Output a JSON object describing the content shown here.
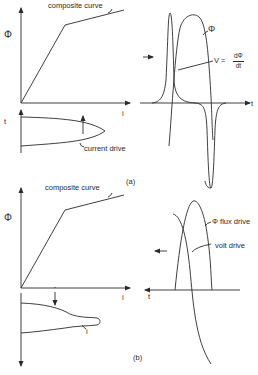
{
  "figure": {
    "panel_a": {
      "label": "(a)",
      "left_plot": {
        "y_axis_label": "Φ",
        "x_axis_label": "i",
        "curve_label": "composite curve",
        "lower_axis_label": "t",
        "drive_label": "current drive",
        "arrow_direction": "up"
      },
      "right_plot": {
        "x_axis_label": "t",
        "phi_label": "Φ",
        "v_label_prefix": "V =",
        "v_label_num": "dΦ",
        "v_label_den": "dt",
        "arrow_direction": "right"
      }
    },
    "panel_b": {
      "label": "(b)",
      "left_plot": {
        "y_axis_label": "Φ",
        "x_axis_label": "i",
        "curve_label": "composite curve",
        "current_label": "i",
        "arrow_direction": "down"
      },
      "right_plot": {
        "x_axis_label": "t",
        "flux_label": "Φ flux drive",
        "volt_label": "volt drive",
        "arrow_direction": "left"
      }
    },
    "line_color": "#2a2a2a",
    "background": "#ffffff"
  }
}
